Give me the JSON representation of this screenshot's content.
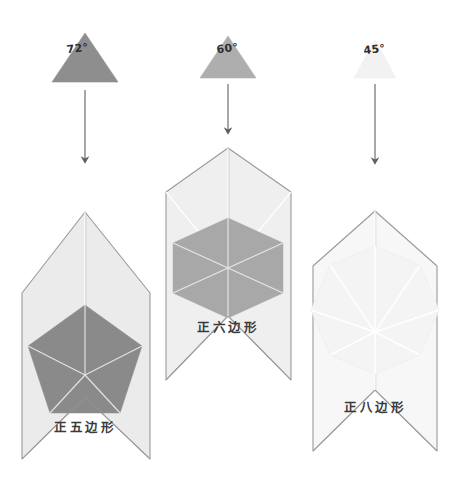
{
  "figure": {
    "background_color": "#ffffff",
    "columns": [
      {
        "id": "pentagon",
        "angle_label": "72°",
        "polygon_label": "正五边形",
        "sides": 5,
        "triangle_fill": "#8e8e8e",
        "polygon_fill": "#8a8a8a",
        "envelope_fill": "#ebebeb",
        "arrow_color": "#6d6d6d",
        "arrow_label": "down-arrow"
      },
      {
        "id": "hexagon",
        "angle_label": "60°",
        "polygon_label": "正六边形",
        "sides": 6,
        "triangle_fill": "#aeaeae",
        "polygon_fill": "#a8a8a8",
        "envelope_fill": "#efefef",
        "arrow_color": "#6d6d6d",
        "arrow_label": "down-arrow"
      },
      {
        "id": "octagon",
        "angle_label": "45°",
        "polygon_label": "正八边形",
        "sides": 8,
        "triangle_fill": "#f2f2f2",
        "polygon_fill": "#f4f4f4",
        "envelope_fill": "#f7f7f7",
        "arrow_color": "#6d6d6d",
        "arrow_label": "down-arrow"
      }
    ],
    "colors": {
      "outline": "#9a9a9a",
      "fold_line": "#ffffff",
      "dark_fold_line": "#8f8f8f",
      "text": "#3a3a3a"
    }
  }
}
